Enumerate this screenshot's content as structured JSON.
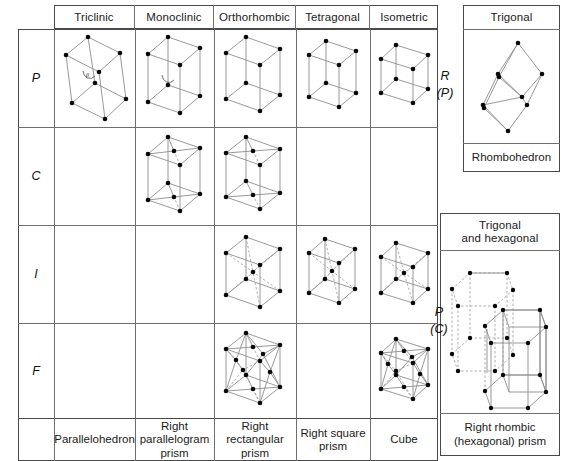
{
  "main_table": {
    "column_headers": [
      "Triclinic",
      "Monoclinic",
      "Orthorhombic",
      "Tetragonal",
      "Isometric"
    ],
    "row_labels": [
      "P",
      "C",
      "I",
      "F"
    ],
    "column_footers": [
      "Parallelohedron",
      "Right\nparallelogram\nprism",
      "Right\nrectangular\nprism",
      "Right square\nprism",
      "Cube"
    ],
    "footer_lines": [
      [
        "Parallelohedron"
      ],
      [
        "Right",
        "parallelogram",
        "prism"
      ],
      [
        "Right",
        "rectangular",
        "prism"
      ],
      [
        "Right square",
        "prism"
      ],
      [
        "Cube"
      ]
    ],
    "cells_present": {
      "P": [
        "Triclinic",
        "Monoclinic",
        "Orthorhombic",
        "Tetragonal",
        "Isometric"
      ],
      "C": [
        "Monoclinic",
        "Orthorhombic"
      ],
      "I": [
        "Orthorhombic",
        "Tetragonal",
        "Isometric"
      ],
      "F": [
        "Orthorhombic",
        "Isometric"
      ]
    }
  },
  "trigonal_panel": {
    "header": "Trigonal",
    "side_label_top": "R",
    "side_label_bottom": "(P)",
    "footer": "Rhombohedron"
  },
  "hexagonal_panel": {
    "header_line1": "Trigonal",
    "header_line2": "and hexagonal",
    "side_label_top": "P",
    "side_label_bottom": "(C)",
    "footer_line1": "Right rhombic",
    "footer_line2": "(hexagonal) prism"
  },
  "colors": {
    "node": "#080808",
    "bond": "#8d8d8d",
    "hidden_bond": "#9a9a9a",
    "border": "#4a4a4a",
    "inner_line": "#6f6f6f",
    "text": "#1a1a1a",
    "background": "#ffffff"
  },
  "legend": {
    "angle_marker": "β"
  }
}
